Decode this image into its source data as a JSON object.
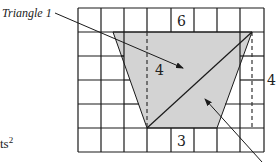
{
  "diagram": {
    "type": "trapezoid-area-on-grid",
    "grid": {
      "columns": 8,
      "rows": 6,
      "left": 78,
      "top": 8,
      "cell_w": 23.25,
      "cell_h": 24
    },
    "trapezoid": {
      "fill": "#d3d3d3",
      "points": [
        [
          113,
          32
        ],
        [
          252,
          32
        ],
        [
          217,
          128
        ],
        [
          147,
          128
        ]
      ]
    },
    "diagonal": {
      "from": [
        147,
        128
      ],
      "to": [
        252,
        32
      ]
    },
    "dashed_heights": [
      {
        "x": 147,
        "y1": 32,
        "y2": 128
      },
      {
        "x": 252,
        "y1": 32,
        "y2": 128
      }
    ],
    "labels": {
      "top_base": "6",
      "bottom_base": "3",
      "inner_height": "4",
      "right_height": "4",
      "triangle1": "Triangle 1",
      "units_fragment": "ts",
      "units_exponent": "2"
    },
    "arrows": [
      {
        "name": "triangle1-pointer",
        "from": [
          55,
          13
        ],
        "to": [
          183,
          68
        ]
      },
      {
        "name": "triangle2-pointer",
        "from": [
          262,
          162
        ],
        "to": [
          205,
          99
        ]
      }
    ]
  }
}
